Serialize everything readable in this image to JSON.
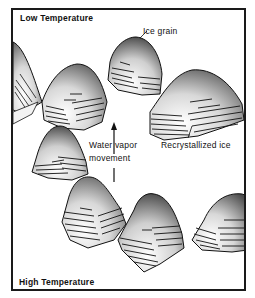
{
  "diagram": {
    "title_top": "Low Temperature",
    "title_bottom": "High Temperature",
    "labels": {
      "ice_grain": "Ice grain",
      "recrystallized_ice": "Recrystallized ice",
      "water_vapor_line1": "Water vapor",
      "water_vapor_line2": "movement"
    },
    "colors": {
      "ink": "#111111",
      "background": "#ffffff",
      "shade": "#6e6e6e"
    }
  }
}
